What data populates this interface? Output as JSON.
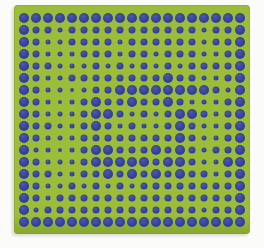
{
  "artwork": {
    "description": "Op-art dot grid: navy-blue dots of varying sizes on a yellow-green square card photographed on a white background",
    "background_color": "#fbfbf9",
    "panel": {
      "x": 14,
      "y": 5,
      "width": 236,
      "height": 229,
      "color": "#9cbd3a",
      "edge_shade_color": "#86a62e",
      "shadow_color": "#d8d8d4",
      "corner_radius": 4
    },
    "dot_grid": {
      "columns": 19,
      "rows": 18,
      "pitch": 12,
      "origin_x": 10,
      "origin_y": 13,
      "dot_color": "#303d95",
      "dot_highlight_color": "#4a57ac",
      "size_classes": {
        "L": 10,
        "M": 7,
        "S": 5,
        "T": 4
      },
      "rows_sizes": [
        "LLLLLLLLLLLLLLLLLLL",
        "LMMSMMMMMMMMMMMSMML",
        "LMSSMMMMSMMMMMMSMML",
        "LMSSSMMMSMMSMMMSSML",
        "LMMSSSMSMSMSMSMMMML",
        "LMSSMMMMMMMMLMMSSML",
        "LMSSTSMMLLLLLLLLMSL",
        "LMSTSMLMMLMMLMSSSML",
        "LMSSSMLLMSMSMLLMSML",
        "LMMSSMLMSMSSMLMSSML",
        "LMSSSMMMMMMMMLMSSML",
        "LSSTSMLLMMMLMLMSMML",
        "LMSSSMLLLLLMLLMSSLL",
        "LMMSSMMLMLMLMLMMSML",
        "LMSSMSMSMSMMMMMMMML",
        "LMSMMMMMMMMMMMMMMML",
        "LSMMMMMMMMMMMMMSMML",
        "LLLLLLLLLLLLLLLLLLL"
      ]
    }
  }
}
